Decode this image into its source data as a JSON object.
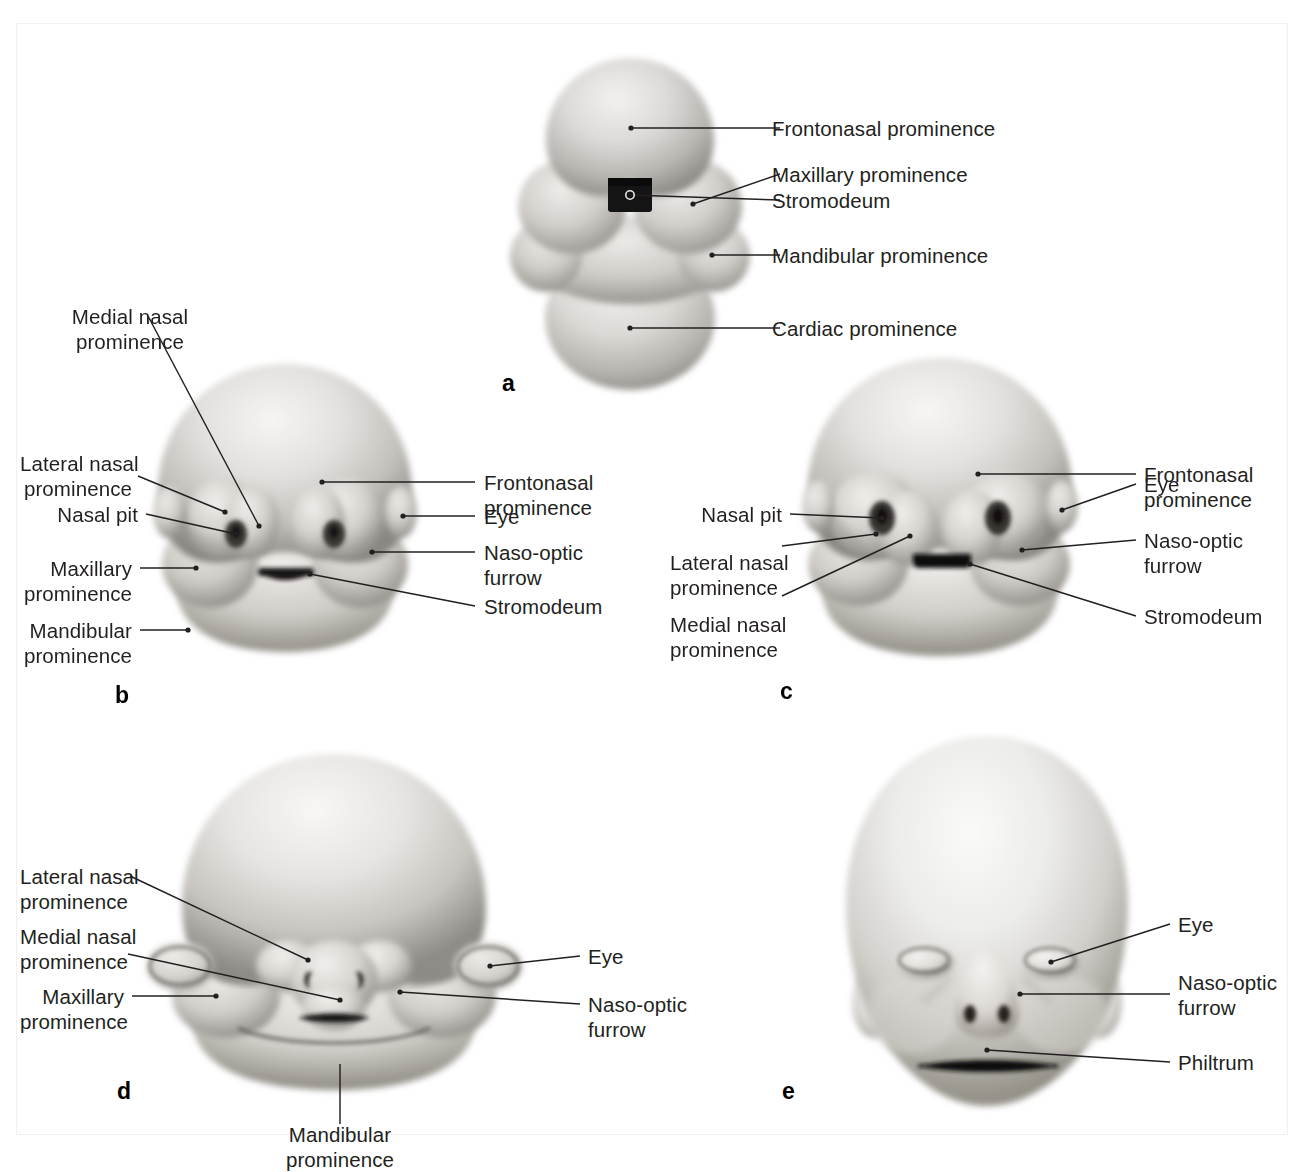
{
  "figure": {
    "background": "#ffffff",
    "frame_color": "#f1f1f2",
    "label_color": "#231f20"
  },
  "panels": [
    {
      "id": "a",
      "letter": "a",
      "caption": "Embryonic head and cardiac prominence, frontal view",
      "labels": [
        {
          "id": "a-frontonasal",
          "text": "Frontonasal prominence",
          "align": "left"
        },
        {
          "id": "a-maxillary",
          "text": "Maxillary prominence",
          "align": "left"
        },
        {
          "id": "a-stromodeum",
          "text": "Stromodeum",
          "align": "left"
        },
        {
          "id": "a-mandibular",
          "text": "Mandibular prominence",
          "align": "left"
        },
        {
          "id": "a-cardiac",
          "text": "Cardiac prominence",
          "align": "left"
        }
      ]
    },
    {
      "id": "b",
      "letter": "b",
      "caption": "Early embryonic face with nasal pits",
      "labels": [
        {
          "id": "b-medial-nasal",
          "text": "Medial nasal\nprominence",
          "align": "center"
        },
        {
          "id": "b-lateral-nasal",
          "text": "Lateral nasal\nprominence",
          "align": "right"
        },
        {
          "id": "b-nasal-pit",
          "text": "Nasal pit",
          "align": "right"
        },
        {
          "id": "b-maxillary",
          "text": "Maxillary\nprominence",
          "align": "right"
        },
        {
          "id": "b-mandibular",
          "text": "Mandibular\nprominence",
          "align": "right"
        },
        {
          "id": "b-frontonasal",
          "text": "Frontonasal\nprominence",
          "align": "left"
        },
        {
          "id": "b-eye",
          "text": "Eye",
          "align": "left"
        },
        {
          "id": "b-naso-optic",
          "text": "Naso-optic\nfurrow",
          "align": "left"
        },
        {
          "id": "b-stromodeum",
          "text": "Stromodeum",
          "align": "left"
        }
      ]
    },
    {
      "id": "c",
      "letter": "c",
      "caption": "Embryonic face, nasal prominences enlarging",
      "labels": [
        {
          "id": "c-nasal-pit",
          "text": "Nasal pit",
          "align": "right"
        },
        {
          "id": "c-lateral-nasal",
          "text": "Lateral nasal\nprominence",
          "align": "right"
        },
        {
          "id": "c-medial-nasal",
          "text": "Medial nasal\nprominence",
          "align": "right"
        },
        {
          "id": "c-frontonasal",
          "text": "Frontonasal\nprominence",
          "align": "left"
        },
        {
          "id": "c-eye",
          "text": "Eye",
          "align": "left"
        },
        {
          "id": "c-naso-optic",
          "text": "Naso-optic\nfurrow",
          "align": "left"
        },
        {
          "id": "c-stromodeum",
          "text": "Stromodeum",
          "align": "left"
        }
      ]
    },
    {
      "id": "d",
      "letter": "d",
      "caption": "Fusion of the facial prominences",
      "labels": [
        {
          "id": "d-lateral-nasal",
          "text": "Lateral nasal\nprominence",
          "align": "right"
        },
        {
          "id": "d-medial-nasal",
          "text": "Medial nasal\nprominence",
          "align": "right"
        },
        {
          "id": "d-maxillary",
          "text": "Maxillary\nprominence",
          "align": "right"
        },
        {
          "id": "d-eye",
          "text": "Eye",
          "align": "left"
        },
        {
          "id": "d-naso-optic",
          "text": "Naso-optic\nfurrow",
          "align": "left"
        },
        {
          "id": "d-mandibular",
          "text": "Mandibular\nprominence",
          "align": "center"
        }
      ]
    },
    {
      "id": "e",
      "letter": "e",
      "caption": "Fetal face",
      "labels": [
        {
          "id": "e-eye",
          "text": "Eye",
          "align": "left"
        },
        {
          "id": "e-naso-optic",
          "text": "Naso-optic\nfurrow",
          "align": "left"
        },
        {
          "id": "e-philtrum",
          "text": "Philtrum",
          "align": "left"
        }
      ]
    }
  ]
}
